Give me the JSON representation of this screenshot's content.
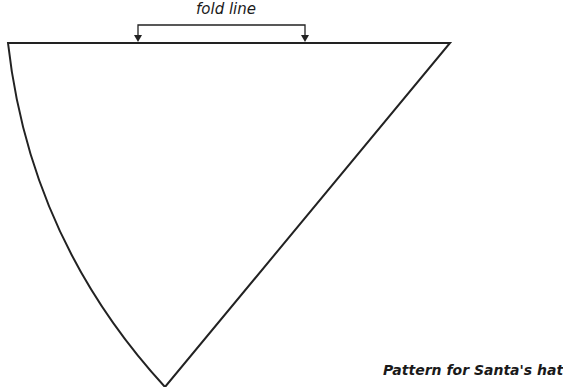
{
  "diagram": {
    "title": "Pattern for Santa's hat",
    "fold_label": "fold line",
    "colors": {
      "stroke": "#222222",
      "background": "#ffffff"
    },
    "shape": "quarter-circle wedge (cone pattern)",
    "annotations": [
      {
        "type": "bracket-with-arrows",
        "label": "fold line",
        "points_to": "top edge"
      }
    ]
  }
}
